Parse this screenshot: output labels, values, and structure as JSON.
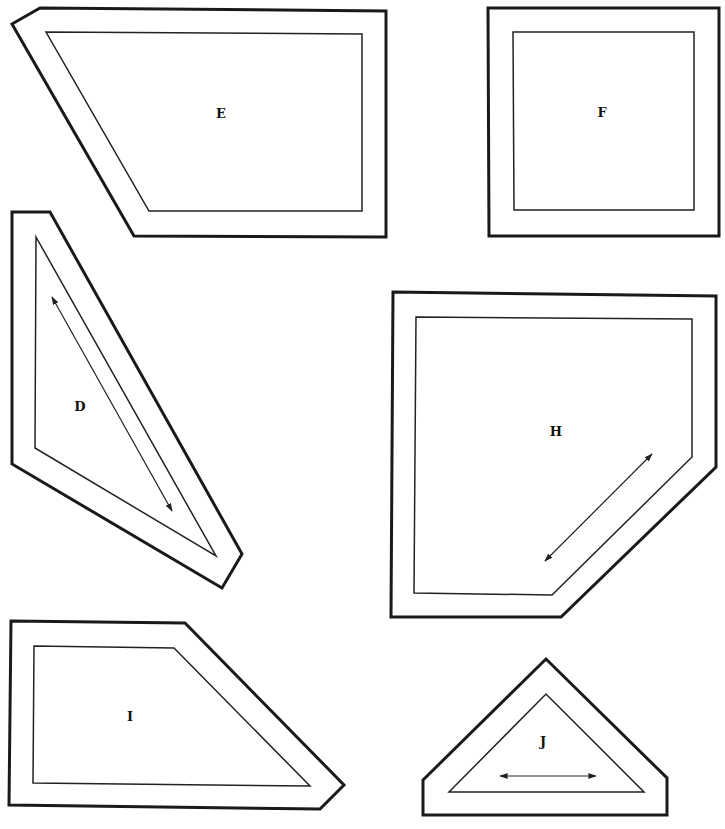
{
  "pieces": [
    {
      "id": "E",
      "label": "E",
      "outer": "12,24 40,8 386,11 386,237 134,236",
      "inner": "46,32 362,34 362,211 149,211",
      "label_pos": [
        221,
        114
      ],
      "arrow": null
    },
    {
      "id": "F",
      "label": "F",
      "outer": "488,8 719,8 719,236 489,236",
      "inner": "513,32 694,32 694,210 514,210",
      "label_pos": [
        602,
        113
      ],
      "arrow": null
    },
    {
      "id": "D",
      "label": "D",
      "outer": "12,212 50,212 242,554 222,588 12,464",
      "inner": "36,237 216,556 35,448",
      "label_pos": [
        80,
        407
      ],
      "arrow": [
        52,
        297,
        172,
        511
      ]
    },
    {
      "id": "H",
      "label": "H",
      "outer": "393,292 716,296 716,467 561,617 391,617",
      "inner": "416,317 692,319 692,457 552,595 414,593",
      "label_pos": [
        556,
        432
      ],
      "arrow": [
        545,
        561,
        652,
        454
      ]
    },
    {
      "id": "I",
      "label": "I",
      "outer": "11,621 185,623 344,785 320,809 9,805",
      "inner": "34,646 174,648 310,786 33,783",
      "label_pos": [
        130,
        717
      ],
      "arrow": null
    },
    {
      "id": "J",
      "label": "J",
      "outer": "423,780 546,659 667,778 667,815 423,815",
      "inner": "449,792 546,694 644,792",
      "label_pos": [
        543,
        742
      ],
      "arrow": [
        500,
        776,
        596,
        776
      ]
    }
  ],
  "colors": {
    "background": "#ffffff",
    "stroke": "#1a1a1a"
  }
}
